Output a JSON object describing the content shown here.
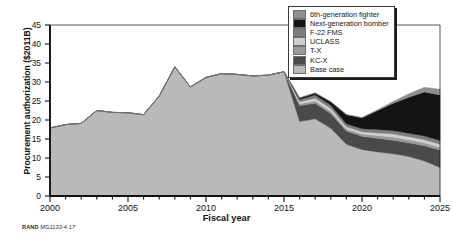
{
  "figure": {
    "credit_org": "RAND",
    "credit_number": "MG1133-4.17"
  },
  "chart_data": {
    "type": "area",
    "stacked": true,
    "title": "",
    "xlabel": "Fiscal year",
    "ylabel": "Procurement authorization ($2011B)",
    "xlim": [
      2000,
      2025
    ],
    "ylim": [
      0,
      45
    ],
    "ytick_step": 5,
    "xtick_step": 1,
    "xtick_label_step": 5,
    "grid": false,
    "legend_position": "top-right",
    "ytick_labels": [
      "0",
      "5",
      "10",
      "15",
      "20",
      "25",
      "30",
      "35",
      "40",
      "45"
    ],
    "xtick_labels": [
      "2000",
      "2005",
      "2010",
      "2015",
      "2020",
      "2025"
    ],
    "x": [
      2000,
      2001,
      2002,
      2003,
      2004,
      2005,
      2006,
      2007,
      2008,
      2009,
      2010,
      2011,
      2012,
      2013,
      2014,
      2015,
      2016,
      2017,
      2018,
      2019,
      2020,
      2021,
      2022,
      2023,
      2024,
      2025
    ],
    "series": [
      {
        "name": "Base case",
        "color": "#b9b9b9",
        "values": [
          17.9,
          18.8,
          19.1,
          22.5,
          22.0,
          21.9,
          21.4,
          26.3,
          34.0,
          28.7,
          31.2,
          32.2,
          32.0,
          31.6,
          31.8,
          32.7,
          19.6,
          20.3,
          17.8,
          13.6,
          12.2,
          11.6,
          11.1,
          10.4,
          9.2,
          7.5
        ]
      },
      {
        "name": "KC-X",
        "color": "#4a4a4a",
        "values": [
          0,
          0,
          0,
          0,
          0,
          0,
          0,
          0,
          0,
          0,
          0,
          0,
          0,
          0,
          0,
          0,
          4.2,
          4.1,
          3.9,
          3.5,
          3.5,
          3.6,
          3.6,
          3.6,
          4.0,
          4.6
        ]
      },
      {
        "name": "T-X",
        "color": "#9a9a9a",
        "values": [
          0,
          0,
          0,
          0,
          0,
          0,
          0,
          0,
          0,
          0,
          0,
          0,
          0,
          0,
          0,
          0,
          0.5,
          0.6,
          0.6,
          0.5,
          0.6,
          0.7,
          0.8,
          0.8,
          0.8,
          0.7
        ]
      },
      {
        "name": "UCLASS",
        "color": "#cfcfcf",
        "values": [
          0,
          0,
          0,
          0,
          0,
          0,
          0,
          0,
          0,
          0,
          0,
          0,
          0,
          0,
          0,
          0,
          0.5,
          0.7,
          0.7,
          0.6,
          0.6,
          0.7,
          0.8,
          0.8,
          0.8,
          0.8
        ]
      },
      {
        "name": "F-22 FMS",
        "color": "#7d7d7d",
        "values": [
          0,
          0,
          0,
          0,
          0,
          0,
          0,
          0,
          0,
          0,
          0,
          0,
          0,
          0,
          0,
          0,
          0.6,
          0.9,
          0.9,
          0.8,
          0.8,
          0.9,
          0.9,
          0.9,
          1.0,
          1.0
        ]
      },
      {
        "name": "Next-generation bomber",
        "color": "#141414",
        "values": [
          0,
          0,
          0,
          0,
          0,
          0,
          0,
          0,
          0,
          0,
          0,
          0,
          0,
          0,
          0,
          0,
          0.4,
          0.5,
          0.9,
          2.4,
          2.9,
          5.0,
          7.2,
          9.5,
          11.6,
          12.0
        ]
      },
      {
        "name": "6th-generation fighter",
        "color": "#8e8e8e",
        "values": [
          0,
          0,
          0,
          0,
          0,
          0,
          0,
          0,
          0,
          0,
          0,
          0,
          0,
          0,
          0,
          0,
          0,
          0,
          0,
          0,
          0,
          0.2,
          0.5,
          0.9,
          1.2,
          1.5
        ]
      }
    ],
    "legend": [
      {
        "label": "6th-generation fighter",
        "color": "#8e8e8e"
      },
      {
        "label": "Next-generation bomber",
        "color": "#141414"
      },
      {
        "label": "F-22 FMS",
        "color": "#7d7d7d"
      },
      {
        "label": "UCLASS",
        "color": "#cfcfcf"
      },
      {
        "label": "T-X",
        "color": "#9a9a9a"
      },
      {
        "label": "KC-X",
        "color": "#4a4a4a"
      },
      {
        "label": "Base case",
        "color": "#b9b9b9"
      }
    ]
  }
}
